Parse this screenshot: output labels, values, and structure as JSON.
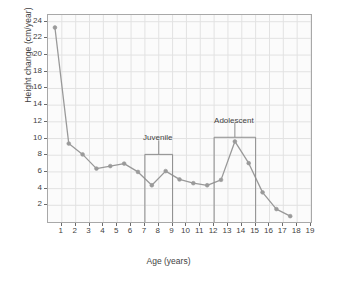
{
  "chart_data": {
    "type": "line",
    "title": "",
    "xlabel": "Age (years)",
    "ylabel": "Height change (cm/year)",
    "xlim": [
      0,
      19
    ],
    "ylim": [
      0,
      24.8
    ],
    "grid": true,
    "legend_position": "none",
    "x": [
      0.5,
      1.5,
      2.5,
      3.5,
      4.5,
      5.5,
      6.5,
      7.5,
      8.5,
      9.5,
      10.5,
      11.5,
      12.5,
      13.5,
      14.5,
      15.5,
      16.5,
      17.5
    ],
    "values": [
      23.3,
      9.4,
      8.1,
      6.4,
      6.7,
      7.0,
      6.0,
      4.4,
      6.1,
      5.1,
      4.65,
      4.4,
      5.05,
      9.65,
      7.05,
      3.55,
      1.55,
      0.7
    ],
    "series": [
      {
        "name": "Height velocity",
        "values": [
          23.3,
          9.4,
          8.1,
          6.4,
          6.7,
          7.0,
          6.0,
          4.4,
          6.1,
          5.1,
          4.65,
          4.4,
          5.05,
          9.65,
          7.05,
          3.55,
          1.55,
          0.7
        ],
        "color": "#999999",
        "marker": "circle"
      }
    ],
    "xticks": [
      1,
      2,
      3,
      4,
      5,
      6,
      7,
      8,
      9,
      10,
      11,
      12,
      13,
      14,
      15,
      16,
      17,
      18,
      19
    ],
    "xticklabels": [
      "1",
      "2",
      "3",
      "4",
      "5",
      "6",
      "7",
      "8",
      "9",
      "10",
      "11",
      "12",
      "13",
      "14",
      "15",
      "16",
      "17",
      "18",
      "19"
    ],
    "yticks": [
      2,
      4,
      6,
      8,
      10,
      12,
      14,
      16,
      18,
      20,
      22,
      24
    ],
    "yticklabels": [
      "2",
      "4",
      "6",
      "8",
      "10",
      "12",
      "14",
      "16",
      "18",
      "20",
      "22",
      "24"
    ],
    "annotations": [
      {
        "text": "Juvenile",
        "x_start": 7,
        "x_end": 9,
        "y_top": 8.1,
        "label_x": 8,
        "label_y": 9.3
      },
      {
        "text": "Adolescent",
        "x_start": 12,
        "x_end": 15,
        "y_top": 10.15,
        "label_x": 13.5,
        "label_y": 11.4
      }
    ]
  },
  "style": {
    "line_color": "#999999",
    "marker_color": "#9a9a9a",
    "grid_color": "#e2e2e2",
    "axis_color": "#a8a8a8",
    "plot_background": "#fbfbfb",
    "text_color": "#3f3f3f",
    "bracket_color": "#8c8c8c"
  }
}
